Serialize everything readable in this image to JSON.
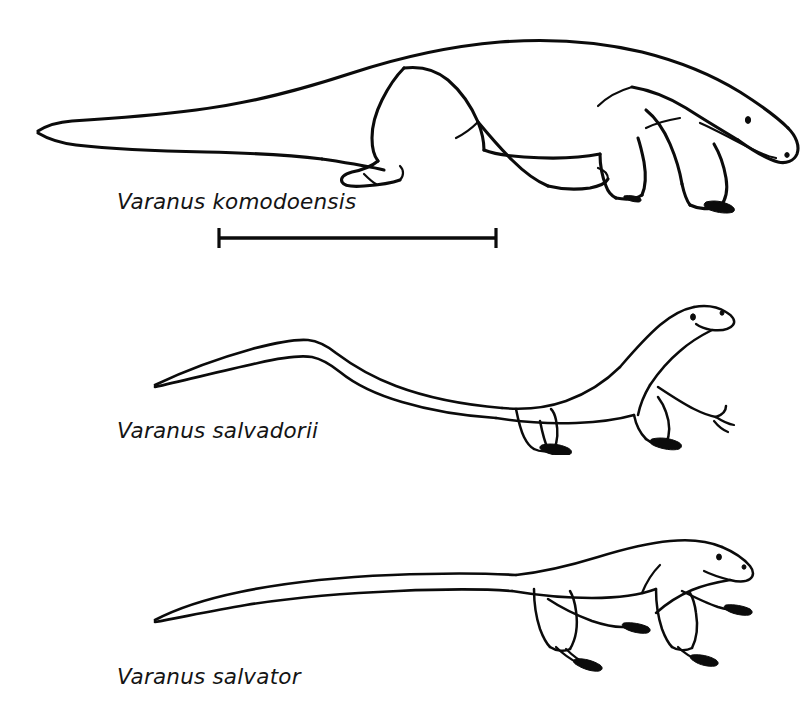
{
  "figure": {
    "type": "scientific-line-illustration",
    "background_color": "#ffffff",
    "ink_color": "#0b0b0b",
    "width": 812,
    "height": 709
  },
  "specimens": [
    {
      "id": "komodoensis",
      "label": "Varanus komodoensis",
      "position": "top",
      "pose": "standing, head lowered toward ground, heavy body, thick tapering tail",
      "label_position": {
        "x": 117,
        "y": 189
      }
    },
    {
      "id": "salvadorii",
      "label": "Varanus salvadorii",
      "position": "middle",
      "pose": "head raised upward, slender neck, very long whip-like arched tail",
      "label_position": {
        "x": 117,
        "y": 418
      }
    },
    {
      "id": "salvator",
      "label": "Varanus salvator",
      "position": "bottom",
      "pose": "head held horizontally, blunt snout, long tapering tail",
      "label_position": {
        "x": 117,
        "y": 664
      }
    }
  ],
  "scale_bar": {
    "name": "scale-bar",
    "caption": "",
    "x_start": 218,
    "x_end": 497,
    "y": 238,
    "length_px": 279,
    "end_caps": "vertical serif ticks"
  }
}
